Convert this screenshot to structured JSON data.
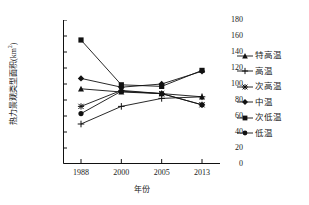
{
  "chart_data": {
    "type": "line",
    "title": "",
    "xlabel": "年份",
    "ylabel": "热力景观类型面积(km2)",
    "ylabel_base": "热力景观类型面积(km",
    "ylabel_sup": "2",
    "ylabel_close": ")",
    "categories": [
      "1988",
      "2000",
      "2005",
      "2013"
    ],
    "x": [
      1988,
      2000,
      2005,
      2013
    ],
    "ylim": [
      0,
      180
    ],
    "ytick_values": [
      0,
      20,
      40,
      60,
      80,
      100,
      120,
      140,
      160,
      180
    ],
    "ytick_labels": [
      "0",
      "20",
      "40",
      "60",
      "80",
      "100",
      "120",
      "140",
      "160",
      "180"
    ],
    "grid": false,
    "legend_position": "right",
    "line_color": "#111111",
    "series": [
      {
        "name": "特高温",
        "marker": "triangle",
        "values": [
          94,
          90,
          88,
          84
        ]
      },
      {
        "name": "高温",
        "marker": "plus",
        "values": [
          50,
          72,
          82,
          84
        ]
      },
      {
        "name": "次高温",
        "marker": "star",
        "values": [
          72,
          92,
          88,
          74
        ]
      },
      {
        "name": "中温",
        "marker": "diamond",
        "values": [
          107,
          96,
          100,
          116
        ]
      },
      {
        "name": "次低温",
        "marker": "square",
        "values": [
          155,
          99,
          97,
          117
        ]
      },
      {
        "name": "低温",
        "marker": "circle",
        "values": [
          63,
          91,
          88,
          74
        ]
      }
    ]
  },
  "legend": {
    "items": [
      {
        "label": "特高温",
        "marker": "triangle"
      },
      {
        "label": "高温",
        "marker": "plus"
      },
      {
        "label": "次高温",
        "marker": "star"
      },
      {
        "label": "中温",
        "marker": "diamond"
      },
      {
        "label": "次低温",
        "marker": "square"
      },
      {
        "label": "低温",
        "marker": "circle"
      }
    ]
  }
}
